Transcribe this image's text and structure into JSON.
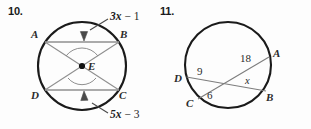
{
  "worksheet": {
    "background_color": "#fdfdfd",
    "ink_color": "#2b2b2b",
    "chord_color": "#8c8c8c"
  },
  "problems": [
    {
      "number": "10.",
      "figure_type": "circle-with-two-parallel-chords-and-diagonals",
      "center_label": "E",
      "points": [
        {
          "id": "A",
          "label": "A"
        },
        {
          "id": "B",
          "label": "B"
        },
        {
          "id": "C",
          "label": "C"
        },
        {
          "id": "D",
          "label": "D"
        }
      ],
      "annotations": [
        {
          "id": "top-chord-label",
          "text": "3x − 1",
          "coefficient": "3",
          "variable": "x",
          "operator": "−",
          "constant": "1",
          "points_to": "chord-AB"
        },
        {
          "id": "bottom-chord-label",
          "text": "5x − 3",
          "coefficient": "5",
          "variable": "x",
          "operator": "−",
          "constant": "3",
          "points_to": "chord-DC"
        }
      ]
    },
    {
      "number": "11.",
      "figure_type": "circle-with-two-intersecting-chords",
      "points": [
        {
          "id": "A",
          "label": "A"
        },
        {
          "id": "B",
          "label": "B"
        },
        {
          "id": "C",
          "label": "C"
        },
        {
          "id": "D",
          "label": "D"
        }
      ],
      "segment_labels": [
        {
          "id": "segment-18",
          "text": "18",
          "value": 18
        },
        {
          "id": "segment-9",
          "text": "9",
          "value": 9
        },
        {
          "id": "segment-6",
          "text": "6",
          "value": 6
        },
        {
          "id": "segment-x",
          "text": "x",
          "value": "x"
        }
      ]
    }
  ]
}
